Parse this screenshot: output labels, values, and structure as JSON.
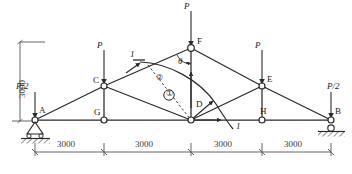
{
  "figure": {
    "type": "structural-truss-diagram",
    "title": "",
    "stroke_color": "#2b2b2b",
    "dim_color": "#555555",
    "node_fill": "#ffffff"
  },
  "nodes": [
    {
      "id": "A",
      "label": "A",
      "x": 35,
      "y": 120,
      "label_dx": 4,
      "label_dy": -14,
      "support": "pin"
    },
    {
      "id": "G",
      "label": "G",
      "x": 104,
      "y": 120,
      "label_dx": -10,
      "label_dy": -12,
      "support": "none"
    },
    {
      "id": "D",
      "label": "D",
      "x": 191,
      "y": 120,
      "label_dx": 5,
      "label_dy": -20,
      "support": "none"
    },
    {
      "id": "H",
      "label": "H",
      "x": 262,
      "y": 120,
      "label_dx": -2,
      "label_dy": -13,
      "support": "none"
    },
    {
      "id": "B",
      "label": "B",
      "x": 331,
      "y": 120,
      "label_dx": 4,
      "label_dy": -13,
      "support": "roller"
    },
    {
      "id": "C",
      "label": "C",
      "x": 104,
      "y": 86,
      "label_dx": -11,
      "label_dy": -10,
      "support": "none"
    },
    {
      "id": "E",
      "label": "E",
      "x": 262,
      "y": 86,
      "label_dx": 5,
      "label_dy": -11,
      "support": "none"
    },
    {
      "id": "F",
      "label": "F",
      "x": 191,
      "y": 48,
      "label_dx": 6,
      "label_dy": -11,
      "support": "none"
    }
  ],
  "members": [
    {
      "from": "A",
      "to": "C",
      "kind": "top-chord"
    },
    {
      "from": "C",
      "to": "F",
      "kind": "top-chord"
    },
    {
      "from": "F",
      "to": "E",
      "kind": "top-chord"
    },
    {
      "from": "E",
      "to": "B",
      "kind": "top-chord"
    },
    {
      "from": "A",
      "to": "G",
      "kind": "bottom-chord"
    },
    {
      "from": "G",
      "to": "D",
      "kind": "bottom-chord"
    },
    {
      "from": "D",
      "to": "H",
      "kind": "bottom-chord"
    },
    {
      "from": "H",
      "to": "B",
      "kind": "bottom-chord"
    },
    {
      "from": "C",
      "to": "G",
      "kind": "vertical-web"
    },
    {
      "from": "F",
      "to": "D",
      "kind": "vertical-web"
    },
    {
      "from": "E",
      "to": "H",
      "kind": "vertical-web"
    },
    {
      "from": "C",
      "to": "D",
      "kind": "diagonal-web"
    },
    {
      "from": "E",
      "to": "D",
      "kind": "diagonal-web"
    }
  ],
  "loads": [
    {
      "id": "load-A",
      "label": "P/2",
      "at": "A",
      "x": 35,
      "tip_y": 120,
      "tail_y": 92,
      "label_dx": -20,
      "label_dy": -38
    },
    {
      "id": "load-C",
      "label": "P",
      "at": "C",
      "x": 104,
      "tip_y": 86,
      "tail_y": 50,
      "label_dx": -8,
      "label_dy": -42
    },
    {
      "id": "load-F",
      "label": "P",
      "at": "F",
      "x": 191,
      "tip_y": 48,
      "tail_y": 10,
      "label_dx": -8,
      "label_dy": -44
    },
    {
      "id": "load-E",
      "label": "P",
      "at": "E",
      "x": 262,
      "tip_y": 86,
      "tail_y": 50,
      "label_dx": -8,
      "label_dy": -42
    },
    {
      "id": "load-B",
      "label": "P/2",
      "at": "B",
      "x": 331,
      "tip_y": 120,
      "tail_y": 92,
      "label_dx": 3,
      "label_dy": -38
    }
  ],
  "section_cut": {
    "label_top": "1",
    "label_bottom": "1",
    "label_top_pos": {
      "x": 133,
      "y": 55
    },
    "label_bottom_pos": {
      "x": 240,
      "y": 126
    },
    "description": "wavy section line 1-1"
  },
  "angle": {
    "symbol": "θ",
    "x": 183,
    "y": 60,
    "at_node": "F"
  },
  "internal_forces": [
    {
      "id": "force-circled-1",
      "symbol": "①",
      "x": 169,
      "y": 94
    },
    {
      "id": "force-axial-label",
      "symbol": "②",
      "x": 159,
      "y": 78
    }
  ],
  "dimensions": {
    "vertical": {
      "label": "3000",
      "x": 20,
      "top_y": 42,
      "bottom_y": 121,
      "text_x": 14,
      "text_y": 100
    },
    "horizontal": {
      "y": 152,
      "ticks_x": [
        35,
        104,
        191,
        262,
        331
      ],
      "spans": [
        {
          "label": "3000",
          "center_x": 69
        },
        {
          "label": "3000",
          "center_x": 147
        },
        {
          "label": "3000",
          "center_x": 226
        },
        {
          "label": "3000",
          "center_x": 296
        }
      ]
    }
  },
  "supports": {
    "left": {
      "type": "pin",
      "node": "A",
      "hatch": true
    },
    "right": {
      "type": "roller",
      "node": "B",
      "hatch": true
    }
  }
}
